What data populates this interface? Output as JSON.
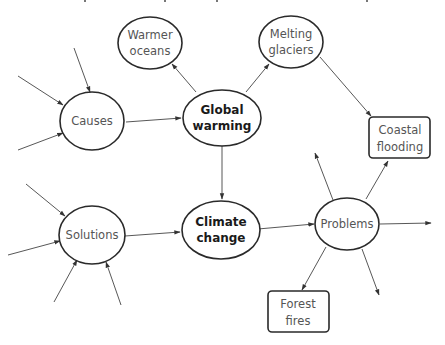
{
  "diagram": {
    "type": "concept-map",
    "colors": {
      "background": "#ffffff",
      "node_border": "#2a2a2a",
      "edge": "#444444",
      "text_normal": "#555555",
      "text_bold": "#1a1a1a"
    },
    "nodes": [
      {
        "id": "warmer_oceans",
        "line1": "Warmer",
        "line2": "oceans",
        "shape": "ellipse",
        "bold": false
      },
      {
        "id": "melting_glaciers",
        "line1": "Melting",
        "line2": "glaciers",
        "shape": "ellipse",
        "bold": false
      },
      {
        "id": "causes",
        "line1": "Causes",
        "line2": "",
        "shape": "ellipse",
        "bold": false
      },
      {
        "id": "global_warming",
        "line1": "Global",
        "line2": "warming",
        "shape": "ellipse",
        "bold": true
      },
      {
        "id": "coastal_flooding",
        "line1": "Coastal",
        "line2": "flooding",
        "shape": "rounded-rect",
        "bold": false
      },
      {
        "id": "solutions",
        "line1": "Solutions",
        "line2": "",
        "shape": "ellipse",
        "bold": false
      },
      {
        "id": "climate_change",
        "line1": "Climate",
        "line2": "change",
        "shape": "ellipse",
        "bold": true
      },
      {
        "id": "problems",
        "line1": "Problems",
        "line2": "",
        "shape": "ellipse",
        "bold": false
      },
      {
        "id": "forest_fires",
        "line1": "Forest",
        "line2": "fires",
        "shape": "rounded-rect",
        "bold": false
      }
    ],
    "edges": [
      {
        "from": "causes",
        "to": "global_warming"
      },
      {
        "from": "global_warming",
        "to": "warmer_oceans"
      },
      {
        "from": "global_warming",
        "to": "melting_glaciers"
      },
      {
        "from": "melting_glaciers",
        "to": "coastal_flooding"
      },
      {
        "from": "global_warming",
        "to": "climate_change"
      },
      {
        "from": "solutions",
        "to": "climate_change"
      },
      {
        "from": "climate_change",
        "to": "problems"
      },
      {
        "from": "problems",
        "to": "coastal_flooding"
      },
      {
        "from": "problems",
        "to": "forest_fires"
      },
      {
        "from": "problems",
        "to": "unlabeled-up"
      },
      {
        "from": "problems",
        "to": "unlabeled-right"
      },
      {
        "from": "problems",
        "to": "unlabeled-down"
      },
      {
        "from": "unlabeled",
        "to": "causes",
        "count": 3
      },
      {
        "from": "unlabeled",
        "to": "solutions",
        "count": 4
      }
    ]
  }
}
